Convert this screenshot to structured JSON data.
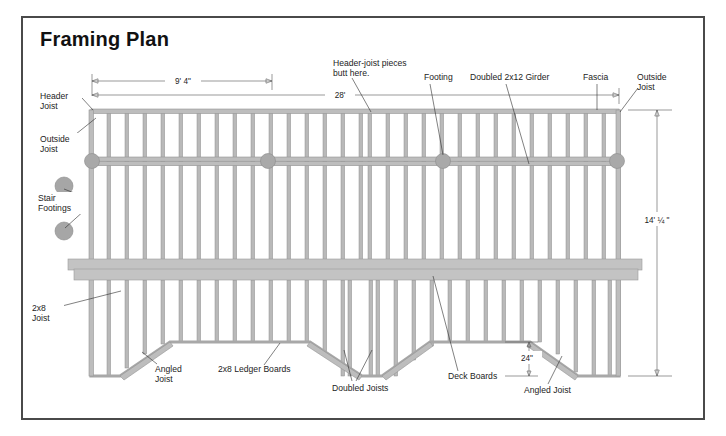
{
  "document": {
    "title": "Framing Plan",
    "background_color": "#ffffff",
    "border_color": "#4a4a4a"
  },
  "colors": {
    "member_fill": "#bdbdbd",
    "member_stroke": "#949494",
    "joist_fill": "#b9b9b9",
    "footing_fill": "#a9a9a9",
    "leader_line": "#2b2b2b",
    "dimension_line": "#555555",
    "text": "#1c1c1c"
  },
  "dimensions": [
    {
      "id": "dim-9-4",
      "label": "9' 4\"",
      "x": 182,
      "y": 80,
      "line_y": 81,
      "x1": 92,
      "x2": 272,
      "orientation": "horizontal"
    },
    {
      "id": "dim-28",
      "label": "28'",
      "x": 340,
      "y": 95,
      "line_y": 95,
      "x1": 92,
      "x2": 619,
      "orientation": "horizontal"
    },
    {
      "id": "dim-14-quarter",
      "label": "14' ¼ \"",
      "x": 655,
      "y": 222,
      "line_x": 628,
      "y1": 110,
      "y2": 372,
      "orientation": "vertical"
    },
    {
      "id": "dim-24",
      "label": "24\"",
      "x": 543,
      "y": 358,
      "line_x": 529,
      "y1": 342,
      "y2": 376,
      "orientation": "vertical"
    }
  ],
  "callouts": [
    {
      "id": "header-joist",
      "label": "Header\nJoist",
      "lines": [
        "Header",
        "Joist"
      ],
      "text_x": 40,
      "text_y": 100,
      "anchor": "start",
      "leader": "M 82,102 L 92,110"
    },
    {
      "id": "outside-joist-left",
      "label": "Outside\nJoist",
      "lines": [
        "Outside",
        "Joist"
      ],
      "text_x": 40,
      "text_y": 144,
      "anchor": "start",
      "leader": "M 76,137 L 96,118"
    },
    {
      "id": "stair-footings",
      "label": "Stair\nFootings",
      "lines": [
        "Stair",
        "Footings"
      ],
      "text_x": 38,
      "text_y": 203,
      "anchor": "start",
      "leader": "M 68,196 L 64,189 M 68,213 L 65,228"
    },
    {
      "id": "2x8-joist",
      "label": "2x8\nJoist",
      "lines": [
        "2x8",
        "Joist"
      ],
      "text_x": 32,
      "text_y": 316,
      "anchor": "start",
      "leader": "M 62,308 L 121,291"
    },
    {
      "id": "header-joist-butt",
      "label": "Header-joist pieces\nbutt here.",
      "lines": [
        "Header-joist pieces",
        "butt here."
      ],
      "text_x": 333,
      "text_y": 65,
      "anchor": "start",
      "leader": "M 355,76 L 371,111"
    },
    {
      "id": "footing-label",
      "label": "Footing",
      "lines": [
        "Footing"
      ],
      "text_x": 424,
      "text_y": 80,
      "anchor": "start",
      "leader": "M 430,85 L 443,156"
    },
    {
      "id": "doubled-girder",
      "label": "Doubled 2x12 Girder",
      "lines": [
        "Doubled 2x12 Girder"
      ],
      "text_x": 470,
      "text_y": 80,
      "anchor": "start",
      "leader": "M 505,85 L 528,163"
    },
    {
      "id": "fascia",
      "label": "Fascia",
      "lines": [
        "Fascia"
      ],
      "text_x": 583,
      "text_y": 80,
      "anchor": "start",
      "leader": "M 597,85 L 597,110"
    },
    {
      "id": "outside-joist-right",
      "label": "Outside\nJoist",
      "lines": [
        "Outside",
        "Joist"
      ],
      "text_x": 637,
      "text_y": 80,
      "anchor": "start",
      "leader": "M 638,90 L 620,112"
    },
    {
      "id": "angled-joist-left",
      "label": "Angled\nJoist",
      "lines": [
        "Angled",
        "Joist"
      ],
      "text_x": 155,
      "text_y": 371,
      "anchor": "start",
      "leader": "M 158,365 L 142,354"
    },
    {
      "id": "ledger-boards",
      "label": "2x8 Ledger Boards",
      "lines": [
        "2x8 Ledger Boards"
      ],
      "text_x": 218,
      "text_y": 372,
      "anchor": "start",
      "leader": "M 264,365 L 278,343"
    },
    {
      "id": "doubled-joists",
      "label": "Doubled Joists",
      "lines": [
        "Doubled Joists"
      ],
      "text_x": 332,
      "text_y": 390,
      "anchor": "start",
      "leader": "M 355,382 L 344,352 M 359,382 L 372,352"
    },
    {
      "id": "deck-boards",
      "label": "Deck Boards",
      "lines": [
        "Deck Boards"
      ],
      "text_x": 448,
      "text_y": 379,
      "anchor": "start",
      "leader": "M 460,372 L 433,278"
    },
    {
      "id": "angled-joist-right",
      "label": "Angled Joist",
      "lines": [
        "Angled Joist"
      ],
      "text_x": 524,
      "text_y": 392,
      "anchor": "start",
      "leader": "M 548,385 L 561,358"
    }
  ],
  "structure": {
    "deck_left": 90,
    "deck_right": 620,
    "deck_top": 110,
    "deck_bottom": 376,
    "girder_y": 161,
    "footings_x": [
      92,
      268,
      443,
      617
    ],
    "stair_footings": [
      {
        "cx": 64,
        "cy": 186,
        "r": 9
      },
      {
        "cx": 64,
        "cy": 231,
        "r": 9
      }
    ],
    "ledger_band_upper": {
      "x": 68,
      "y": 260,
      "w": 574,
      "h": 11
    },
    "ledger_band_lower": {
      "x": 74,
      "y": 269,
      "w": 564,
      "h": 11
    },
    "joist_count": 30,
    "notch_left": {
      "inner_left": 170,
      "inner_right": 310,
      "outer_left": 120,
      "outer_right": 362,
      "top": 342
    },
    "notch_right": {
      "inner_left": 430,
      "inner_right": 530,
      "outer_left": 382,
      "outer_right": 578,
      "top": 342
    }
  }
}
